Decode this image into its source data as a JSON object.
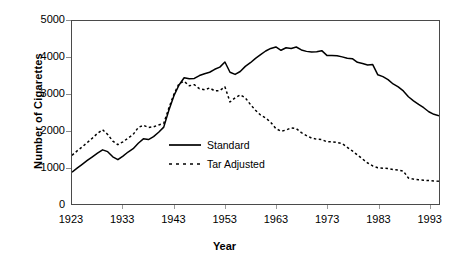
{
  "chart_data": {
    "type": "line",
    "title": "",
    "xlabel": "Year",
    "ylabel": "Number of Cigarettes",
    "xlim": [
      1923,
      1995
    ],
    "ylim": [
      0,
      5000
    ],
    "grid": false,
    "legend_position": "center-left-inside",
    "ytick_labels": [
      "0",
      "1000",
      "2000",
      "3000",
      "4000",
      "5000"
    ],
    "ytick_values": [
      0,
      1000,
      2000,
      3000,
      4000,
      5000
    ],
    "xtick_labels": [
      "1923",
      "1933",
      "1943",
      "1953",
      "1963",
      "1973",
      "1983",
      "1993"
    ],
    "xtick_values": [
      1923,
      1933,
      1943,
      1953,
      1963,
      1973,
      1983,
      1993
    ],
    "x": [
      1923,
      1924,
      1925,
      1926,
      1927,
      1928,
      1929,
      1930,
      1931,
      1932,
      1933,
      1934,
      1935,
      1936,
      1937,
      1938,
      1939,
      1940,
      1941,
      1942,
      1943,
      1944,
      1945,
      1946,
      1947,
      1948,
      1949,
      1950,
      1951,
      1952,
      1953,
      1954,
      1955,
      1956,
      1957,
      1958,
      1959,
      1960,
      1961,
      1962,
      1963,
      1964,
      1965,
      1966,
      1967,
      1968,
      1969,
      1970,
      1971,
      1972,
      1973,
      1974,
      1975,
      1976,
      1977,
      1978,
      1979,
      1980,
      1981,
      1982,
      1983,
      1984,
      1985,
      1986,
      1987,
      1988,
      1989,
      1990,
      1991,
      1992,
      1993,
      1994,
      1995
    ],
    "series": [
      {
        "name": "Standard",
        "style": "solid",
        "color": "#000000",
        "values": [
          870,
          980,
          1085,
          1190,
          1290,
          1390,
          1480,
          1430,
          1290,
          1210,
          1310,
          1420,
          1510,
          1660,
          1780,
          1760,
          1840,
          1960,
          2100,
          2560,
          2960,
          3250,
          3450,
          3420,
          3430,
          3510,
          3560,
          3600,
          3680,
          3740,
          3880,
          3600,
          3540,
          3620,
          3760,
          3860,
          3980,
          4080,
          4180,
          4250,
          4290,
          4200,
          4270,
          4250,
          4290,
          4210,
          4170,
          4150,
          4160,
          4190,
          4060,
          4060,
          4050,
          4020,
          3980,
          3970,
          3870,
          3840,
          3800,
          3810,
          3530,
          3480,
          3400,
          3280,
          3200,
          3090,
          2930,
          2820,
          2720,
          2630,
          2520,
          2450,
          2410
        ]
      },
      {
        "name": "Tar Adjusted",
        "style": "dotted",
        "color": "#000000",
        "values": [
          1330,
          1450,
          1560,
          1680,
          1800,
          1930,
          2030,
          1900,
          1720,
          1620,
          1700,
          1800,
          1900,
          2090,
          2150,
          2090,
          2110,
          2160,
          2200,
          2620,
          3000,
          3290,
          3350,
          3230,
          3260,
          3150,
          3120,
          3170,
          3090,
          3100,
          3200,
          2790,
          2900,
          2980,
          2900,
          2720,
          2560,
          2430,
          2350,
          2230,
          2060,
          1990,
          2020,
          2080,
          2060,
          1950,
          1870,
          1800,
          1770,
          1760,
          1700,
          1700,
          1680,
          1650,
          1550,
          1450,
          1340,
          1230,
          1120,
          1040,
          990,
          980,
          970,
          940,
          930,
          900,
          710,
          680,
          660,
          650,
          640,
          630,
          620
        ]
      }
    ],
    "legend": [
      {
        "label": "Standard",
        "style": "solid"
      },
      {
        "label": "Tar Adjusted",
        "style": "dotted"
      }
    ]
  }
}
